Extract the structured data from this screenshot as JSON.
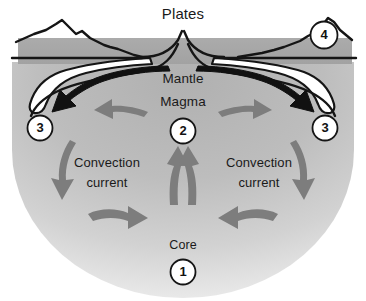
{
  "figure": {
    "title": "Plates"
  },
  "labels": {
    "plates": "Plates",
    "mantle": "Mantle",
    "magma": "Magma",
    "core": "Core",
    "convection_left_line1": "Convection",
    "convection_left_line2": "current",
    "convection_right_line1": "Convection",
    "convection_right_line2": "current"
  },
  "markers": [
    {
      "number": "1",
      "refers_to": "Core"
    },
    {
      "number": "2",
      "refers_to": "Magma"
    },
    {
      "number": "3",
      "refers_to": "Convection current left"
    },
    {
      "number": "3",
      "refers_to": "Convection current right"
    },
    {
      "number": "4",
      "refers_to": "Plates"
    }
  ],
  "colors": {
    "background": "#ffffff",
    "mantle_band": "#a8a8a8",
    "earth_interior_top": "#b3b3b3",
    "earth_interior_bottom": "#e8e8e8",
    "convection_arrow": "#7d7d7d",
    "plate_arrow": "#111111",
    "outline": "#151515",
    "text": "#1a1a1a"
  },
  "icons": {
    "marker_circle": "numbered-circle-icon",
    "convection_arrow": "curved-arrow-icon",
    "plate_motion_arrow": "plate-motion-arrow-icon",
    "magma_rise_arrow": "upward-arrow-icon"
  }
}
